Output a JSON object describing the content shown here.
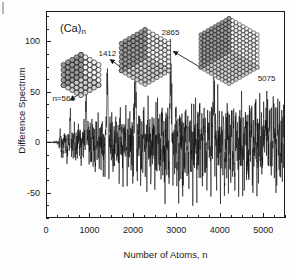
{
  "figure": {
    "series_label": "(Ca)",
    "series_label_sub": "n"
  },
  "chart_data": {
    "type": "line",
    "title": "(Ca)n",
    "xlabel": "Number of Atoms, n",
    "ylabel": "Difference Spectrum",
    "xlim": [
      0,
      5500
    ],
    "ylim": [
      -75,
      130
    ],
    "grid": false,
    "legend": "none",
    "xticks": [
      0,
      1000,
      2000,
      3000,
      4000,
      5000
    ],
    "xtick_labels": [
      "0",
      "1000",
      "2000",
      "3000",
      "4000",
      "5000"
    ],
    "xminor_step": 250,
    "yticks": [
      -50,
      0,
      50,
      100
    ],
    "ytick_labels": [
      "-50",
      "0",
      "50",
      "100"
    ],
    "yminor_step": 12.5,
    "annotations": [
      {
        "name": "n=561",
        "text": "n=561",
        "n": 561,
        "x_label": 561,
        "y_label": 42,
        "peak_height": 28
      },
      {
        "name": "922",
        "text": "922",
        "n": 922,
        "x_label": 922,
        "y_label": 56,
        "peak_height": 44
      },
      {
        "name": "1412",
        "text": "1412",
        "n": 1412,
        "x_label": 1412,
        "y_label": 86,
        "peak_height": 72
      },
      {
        "name": "2053",
        "text": "2053",
        "n": 2053,
        "x_label": 2053,
        "y_label": 92,
        "peak_height": 80
      },
      {
        "name": "2865",
        "text": "2865",
        "n": 2865,
        "x_label": 2865,
        "y_label": 107,
        "peak_height": 88
      },
      {
        "name": "3865",
        "text": "3865",
        "n": 3865,
        "x_label": 3865,
        "y_label": 90,
        "peak_height": 78
      },
      {
        "name": "5075",
        "text": "5075",
        "n": 5075,
        "x_label": 5075,
        "y_label": 62,
        "peak_height": 50
      }
    ],
    "clusters": [
      {
        "name": "cluster-small",
        "shells": 4,
        "points_to_n": 561,
        "points_to_y": 40
      },
      {
        "name": "cluster-medium",
        "shells": 6,
        "points_to_n": 1412,
        "points_to_y": 80
      },
      {
        "name": "cluster-large",
        "shells": 8,
        "points_to_n": 2865,
        "points_to_y": 88
      }
    ],
    "noise": {
      "description": "Difference spectrum oscillation amplitude growing with n",
      "envelope_start_n": 300,
      "envelope_max_amplitude": 42
    }
  }
}
